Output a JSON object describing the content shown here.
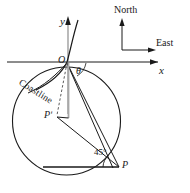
{
  "figure": {
    "background_color": "#ffffff",
    "stroke_color": "#1a1a1a",
    "guide_color": "#9a9a9a",
    "labels": {
      "y_axis": "y",
      "x_axis": "x",
      "origin": "O",
      "theta": "θ",
      "p_prime": "Pʹ",
      "p": "P",
      "angle_45": "45°",
      "coastline": "Coastline",
      "north": "North",
      "east": "East"
    },
    "icons": {
      "y_axis_arrow": "arrow-up-icon",
      "x_axis_arrow": "arrow-right-icon",
      "north_arrow": "arrow-up-icon",
      "east_arrow": "arrow-right-icon"
    },
    "geometry": {
      "circle": {
        "cx": 66.5,
        "cy": 121,
        "r": 54
      },
      "origin": {
        "x": 67,
        "y": 62
      },
      "point_p": {
        "x": 119,
        "y": 167
      },
      "point_p_prime": {
        "x": 57,
        "y": 117
      },
      "angle_value_deg": 45
    }
  }
}
